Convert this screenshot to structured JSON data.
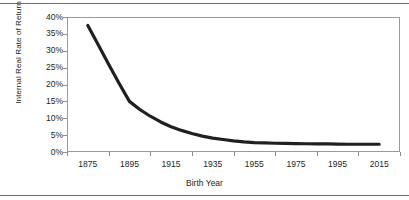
{
  "figure": {
    "rule_color": "#6f6f6f",
    "frame_color": "#9a9a9a",
    "line_color": "#231f20"
  },
  "chart_data": {
    "type": "line",
    "title": "",
    "xlabel": "Birth Year",
    "ylabel": "Internal Real Rate of Return",
    "xlim": [
      1865,
      2025
    ],
    "ylim": [
      0,
      40
    ],
    "grid": false,
    "legend": false,
    "x_tick_labels": [
      "1875",
      "1895",
      "1915",
      "1935",
      "1955",
      "1975",
      "1995",
      "2015"
    ],
    "y_tick_labels": [
      "40%",
      "35%",
      "30%",
      "25%",
      "20%",
      "15%",
      "10%",
      "5%",
      "0%"
    ],
    "y_tick_values": [
      40,
      35,
      30,
      25,
      20,
      15,
      10,
      5,
      0
    ],
    "series": [
      {
        "name": "Internal Real Rate of Return",
        "x": [
          1875,
          1880,
          1885,
          1890,
          1895,
          1900,
          1905,
          1910,
          1915,
          1920,
          1925,
          1930,
          1935,
          1940,
          1945,
          1950,
          1955,
          1960,
          1965,
          1970,
          1975,
          1980,
          1985,
          1990,
          1995,
          2000,
          2005,
          2010,
          2015
        ],
        "values": [
          37.5,
          31.8,
          26.0,
          20.4,
          15.0,
          12.6,
          10.6,
          8.9,
          7.5,
          6.4,
          5.5,
          4.7,
          4.1,
          3.7,
          3.3,
          3.0,
          2.8,
          2.7,
          2.6,
          2.55,
          2.5,
          2.45,
          2.4,
          2.4,
          2.35,
          2.3,
          2.3,
          2.3,
          2.3
        ]
      }
    ]
  }
}
